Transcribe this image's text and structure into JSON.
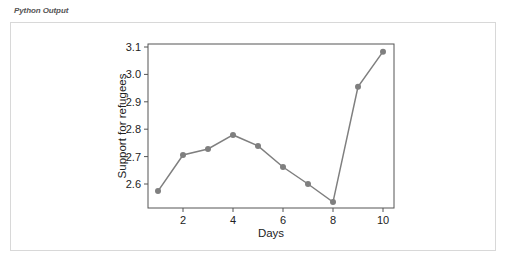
{
  "panel": {
    "title": "Python Output"
  },
  "chart_data": {
    "type": "line",
    "title": "",
    "xlabel": "Days",
    "ylabel": "Support for refugees",
    "x": [
      1,
      2,
      3,
      4,
      5,
      6,
      7,
      8,
      9,
      10
    ],
    "series": [
      {
        "name": "Support for refugees",
        "values": [
          2.574,
          2.706,
          2.728,
          2.779,
          2.739,
          2.662,
          2.6,
          2.534,
          2.955,
          3.083
        ],
        "color": "#7f7f7f",
        "marker": "circle"
      }
    ],
    "xticks": [
      2,
      4,
      6,
      8,
      10
    ],
    "xtick_labels": [
      "2",
      "4",
      "6",
      "8",
      "10"
    ],
    "yticks": [
      2.6,
      2.7,
      2.8,
      2.9,
      3.0,
      3.1
    ],
    "ytick_labels": [
      "2.6",
      "2.7",
      "2.8",
      "2.9",
      "3.0",
      "3.1"
    ],
    "xlim": [
      0.6,
      10.45
    ],
    "ylim": [
      2.51,
      3.11
    ],
    "grid": false,
    "legend": null
  }
}
